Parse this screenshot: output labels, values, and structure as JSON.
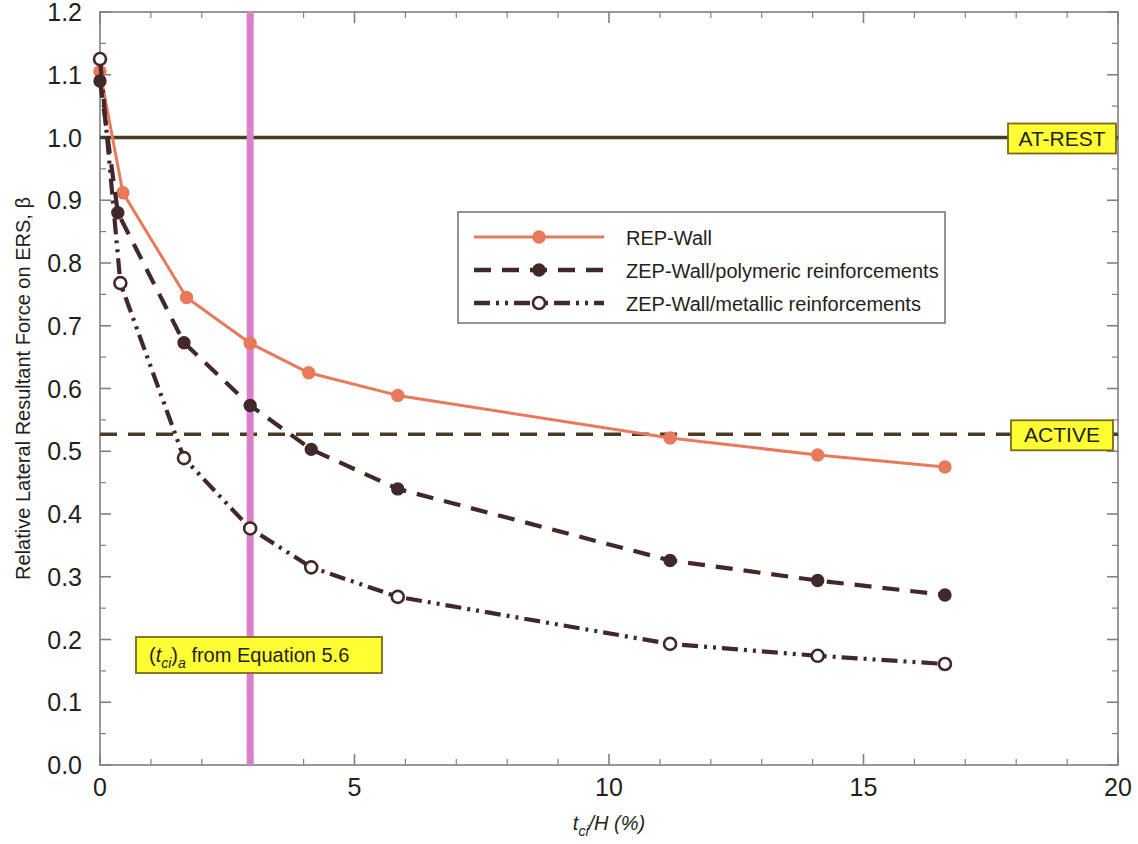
{
  "chart_data": {
    "type": "line",
    "title": "",
    "xlabel": "t_ci/H (%)",
    "xlabel_parts": {
      "base1": "t",
      "sub1": "ci",
      "base2": "/H (%)"
    },
    "ylabel": "Relative Lateral Resultant Force on ERS, β",
    "xlim": [
      0,
      20
    ],
    "ylim": [
      0,
      1.2
    ],
    "xticks": [
      0,
      5,
      10,
      15,
      20
    ],
    "xtick_labels": [
      "0",
      "5",
      "10",
      "15",
      "20"
    ],
    "xminor_step": 1,
    "yticks": [
      0.0,
      0.1,
      0.2,
      0.3,
      0.4,
      0.5,
      0.6,
      0.7,
      0.8,
      0.9,
      1.0,
      1.1,
      1.2
    ],
    "ytick_labels": [
      "0.0",
      "0.1",
      "0.2",
      "0.3",
      "0.4",
      "0.5",
      "0.6",
      "0.7",
      "0.8",
      "0.9",
      "1.0",
      "1.1",
      "1.2"
    ],
    "yminor_step": 0.05,
    "grid": false,
    "legend_position": "upper-center",
    "series": [
      {
        "name": "REP-Wall",
        "style": "solid",
        "color": "#e8795a",
        "marker": "filled-circle",
        "x": [
          0,
          0.45,
          1.7,
          2.95,
          4.1,
          5.85,
          11.2,
          14.1,
          16.6
        ],
        "values": [
          1.105,
          0.912,
          0.745,
          0.672,
          0.625,
          0.589,
          0.521,
          0.494,
          0.475
        ]
      },
      {
        "name": "ZEP-Wall/polymeric reinforcements",
        "style": "dashed",
        "color": "#43282a",
        "marker": "filled-circle",
        "x": [
          0,
          0.35,
          1.65,
          2.95,
          4.15,
          5.85,
          11.2,
          14.1,
          16.6
        ],
        "values": [
          1.09,
          0.88,
          0.673,
          0.573,
          0.503,
          0.44,
          0.326,
          0.294,
          0.271
        ]
      },
      {
        "name": "ZEP-Wall/metallic reinforcements",
        "style": "dash-dot-dot",
        "color": "#43282a",
        "marker": "open-circle",
        "x": [
          0,
          0.4,
          1.65,
          2.95,
          4.15,
          5.85,
          11.2,
          14.1,
          16.6
        ],
        "values": [
          1.125,
          0.768,
          0.489,
          0.377,
          0.315,
          0.268,
          0.193,
          0.174,
          0.161
        ]
      }
    ],
    "reference_lines": [
      {
        "id": "at-rest",
        "orientation": "horizontal",
        "value": 1.0,
        "label": "AT-REST",
        "style": "solid",
        "color": "#4a3c22"
      },
      {
        "id": "active",
        "orientation": "horizontal",
        "value": 0.527,
        "label": "ACTIVE",
        "style": "dashed",
        "color": "#4a3c22"
      },
      {
        "id": "tci-a",
        "orientation": "vertical",
        "value": 2.95,
        "label": "(t_ci)_a from Equation 5.6",
        "style": "solid",
        "color": "#d980c8"
      }
    ],
    "annotations": [
      {
        "id": "equation-note",
        "text": "(t_ci)_a from Equation 5.6",
        "parts": {
          "open": "(",
          "base": "t",
          "sub": "ci",
          "close": ")",
          "sub2": "a",
          "rest": " from Equation 5.6"
        },
        "background": "#ffff33",
        "border": "#7a6a18"
      }
    ],
    "badges": [
      {
        "id": "at-rest-badge",
        "text": "AT-REST",
        "background": "#ffff33",
        "border": "#7a6a18"
      },
      {
        "id": "active-badge",
        "text": "ACTIVE",
        "background": "#ffff33",
        "border": "#7a6a18"
      }
    ],
    "colors": {
      "rep_wall": "#e8795a",
      "zep_dark": "#43282a",
      "reference": "#4a3c22",
      "vertical_marker": "#d980c8",
      "badge_fill": "#ffff33",
      "badge_border": "#7a6a18",
      "axis": "#808080",
      "text": "#231f20"
    }
  }
}
